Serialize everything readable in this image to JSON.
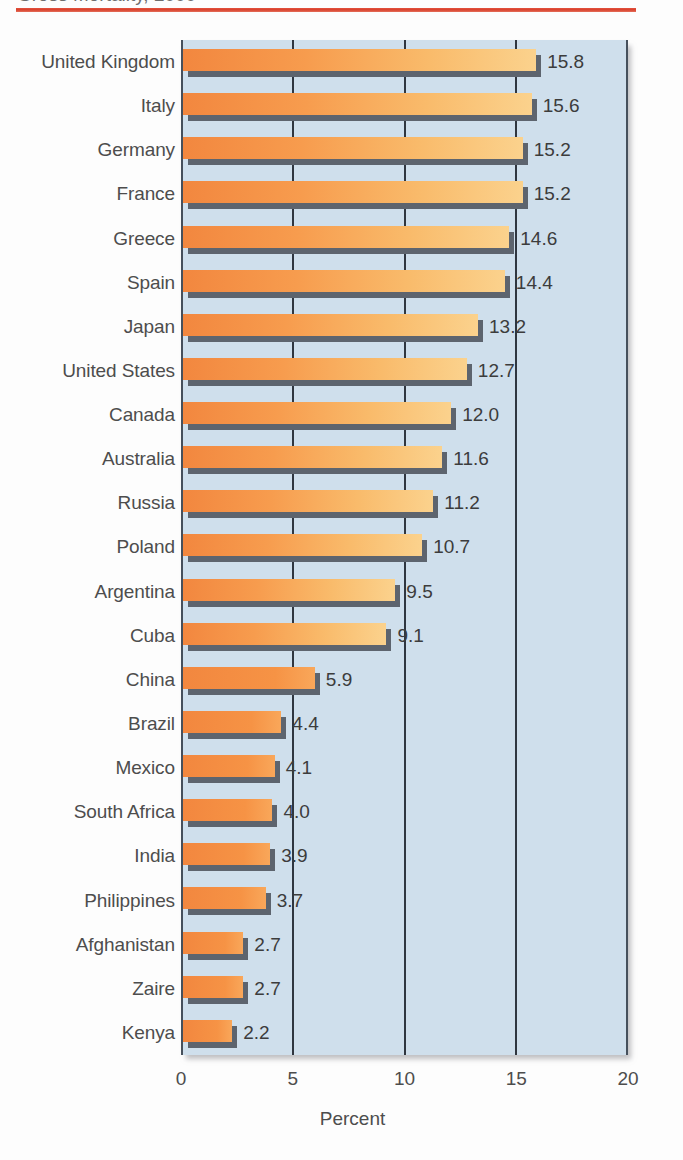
{
  "header": {
    "title": "Gross Mortality, 2000",
    "rule_color": "#d9402c"
  },
  "colors": {
    "plot_background": "#cfdfec",
    "bar_start": "#f2873f",
    "bar_end": "#fbd28d",
    "bar_shadow": "#5d646e",
    "gridline": "#2f3640",
    "label_text": "#4d4d4d"
  },
  "chart_data": {
    "type": "bar",
    "orientation": "horizontal",
    "title": "Gross Mortality, 2000",
    "xlabel": "Percent",
    "ylabel": "",
    "xlim": [
      0,
      20
    ],
    "xticks": [
      "0",
      "5",
      "10",
      "15",
      "20"
    ],
    "xtick_values": [
      0,
      5,
      10,
      15,
      20
    ],
    "grid": true,
    "grid_axis": "x",
    "legend": false,
    "categories": [
      "United Kingdom",
      "Italy",
      "Germany",
      "France",
      "Greece",
      "Spain",
      "Japan",
      "United States",
      "Canada",
      "Australia",
      "Russia",
      "Poland",
      "Argentina",
      "Cuba",
      "China",
      "Brazil",
      "Mexico",
      "South Africa",
      "India",
      "Philippines",
      "Afghanistan",
      "Zaire",
      "Kenya"
    ],
    "values": [
      15.8,
      15.6,
      15.2,
      15.2,
      14.6,
      14.4,
      13.2,
      12.7,
      12.0,
      11.6,
      11.2,
      10.7,
      9.5,
      9.1,
      5.9,
      4.4,
      4.1,
      4.0,
      3.9,
      3.7,
      2.7,
      2.7,
      2.2
    ],
    "value_labels": [
      "15.8",
      "15.6",
      "15.2",
      "15.2",
      "14.6",
      "14.4",
      "13.2",
      "12.7",
      "12.0",
      "11.6",
      "11.2",
      "10.7",
      "9.5",
      "9.1",
      "5.9",
      "4.4",
      "4.1",
      "4.0",
      "3.9",
      "3.7",
      "2.7",
      "2.7",
      "2.2"
    ]
  }
}
